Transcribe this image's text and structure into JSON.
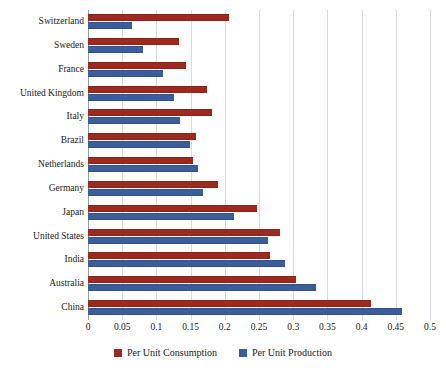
{
  "chart_data": {
    "type": "bar",
    "orientation": "horizontal",
    "title": "",
    "xlabel": "",
    "ylabel": "",
    "xlim": [
      0,
      0.5
    ],
    "xticks": [
      "0",
      "0.05",
      "0.1",
      "0.15",
      "0.2",
      "0.25",
      "0.3",
      "0.35",
      "0.4",
      "0.45",
      "0.5"
    ],
    "xtick_values": [
      0,
      0.05,
      0.1,
      0.15,
      0.2,
      0.25,
      0.3,
      0.35,
      0.4,
      0.45,
      0.5
    ],
    "grid": "vertical",
    "legend_position": "bottom-center",
    "categories": [
      "Switzerland",
      "Sweden",
      "France",
      "United Kingdom",
      "Italy",
      "Brazil",
      "Netherlands",
      "Germany",
      "Japan",
      "United States",
      "India",
      "Australia",
      "China"
    ],
    "series": [
      {
        "name": "Per Unit Consumption",
        "color": "#9c2a1f",
        "values": [
          0.206,
          0.133,
          0.143,
          0.174,
          0.181,
          0.158,
          0.153,
          0.19,
          0.247,
          0.281,
          0.266,
          0.304,
          0.414
        ]
      },
      {
        "name": "Per Unit Production",
        "color": "#3a5e9c",
        "values": [
          0.065,
          0.08,
          0.11,
          0.126,
          0.134,
          0.149,
          0.161,
          0.168,
          0.213,
          0.263,
          0.288,
          0.333,
          0.459
        ]
      }
    ]
  },
  "legend": {
    "items": [
      {
        "label": "Per Unit Consumption",
        "color": "#9c2a1f"
      },
      {
        "label": "Per Unit Production",
        "color": "#3a5e9c"
      }
    ]
  },
  "colors": {
    "consumption": "#9c2a1f",
    "production": "#3a5e9c",
    "gridline": "#d6d9de",
    "axis": "#9aa0a8",
    "background": "#ffffff",
    "text": "#1a1a1a"
  }
}
